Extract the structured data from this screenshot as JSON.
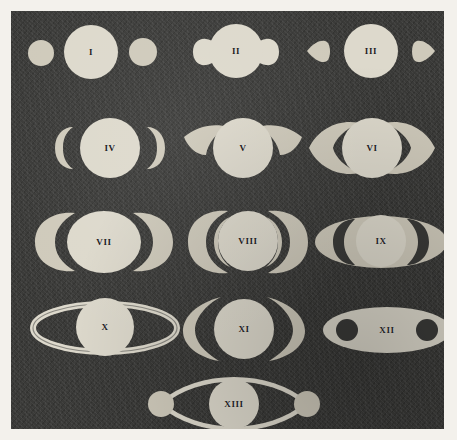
{
  "plate": {
    "title": "Systema Saturnium figure plate",
    "description": "Thirteen historical telescopic appearances of Saturn arranged in four rows plus a final centered figure",
    "background_color": "#3a3a38",
    "body_color": "#ddd9cc",
    "label_color": "#22211f",
    "margin_color": "#f3f1ec"
  },
  "rows": [
    {
      "row": 1,
      "figures": [
        "I",
        "II",
        "III"
      ]
    },
    {
      "row": 2,
      "figures": [
        "IV",
        "V",
        "VI"
      ]
    },
    {
      "row": 3,
      "figures": [
        "VII",
        "VIII",
        "IX"
      ]
    },
    {
      "row": 4,
      "figures": [
        "X",
        "XI",
        "XII"
      ]
    },
    {
      "row": 5,
      "figures": [
        "XIII"
      ]
    }
  ],
  "figures": [
    {
      "id": "I",
      "label": "I",
      "shape": "globe-with-two-detached-round-companions"
    },
    {
      "id": "II",
      "label": "II",
      "shape": "globe-with-attached-bulbous-ears"
    },
    {
      "id": "III",
      "label": "III",
      "shape": "globe-with-two-detached-teardrop-lobes"
    },
    {
      "id": "IV",
      "label": "IV",
      "shape": "globe-with-two-crescent-handles"
    },
    {
      "id": "V",
      "label": "V",
      "shape": "globe-with-swept-crescent-wings"
    },
    {
      "id": "VI",
      "label": "VI",
      "shape": "globe-with-wide-crescent-ring-arms"
    },
    {
      "id": "VII",
      "label": "VII",
      "shape": "oval-globe-with-thick-ring-arcs"
    },
    {
      "id": "VIII",
      "label": "VIII",
      "shape": "globe-with-thin-ring-arcs-and-gap"
    },
    {
      "id": "IX",
      "label": "IX",
      "shape": "narrow-globe-with-flat-ring-ellipse"
    },
    {
      "id": "X",
      "label": "X",
      "shape": "globe-with-open-thin-ring-ellipse"
    },
    {
      "id": "XI",
      "label": "XI",
      "shape": "globe-with-two-vertical-crescent-arcs"
    },
    {
      "id": "XII",
      "label": "XII",
      "shape": "solid-ellipse-with-two-dark-apertures"
    },
    {
      "id": "XIII",
      "label": "XIII",
      "shape": "globe-with-thin-ring-outline-and-two-satellites"
    }
  ]
}
